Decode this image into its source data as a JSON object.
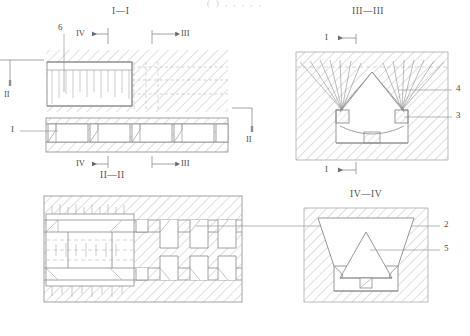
{
  "document": {
    "kind": "patent-figure",
    "cropped_caption_top": "(  )     ,     ,              ,                 ,      ,"
  },
  "views": {
    "section_I": {
      "title": "I—I",
      "callouts": [
        {
          "id": "6",
          "label": "6"
        },
        {
          "id": "1",
          "label": "I"
        }
      ],
      "markers": [
        {
          "label": "IV",
          "direction": "left",
          "position": "top"
        },
        {
          "label": "III",
          "direction": "right",
          "position": "top"
        },
        {
          "label": "II",
          "direction": "down",
          "position": "left"
        },
        {
          "label": "II",
          "direction": "down",
          "position": "right"
        },
        {
          "label": "IV",
          "direction": "left",
          "position": "bottom"
        },
        {
          "label": "III",
          "direction": "right",
          "position": "bottom"
        }
      ]
    },
    "section_II": {
      "title": "II—II",
      "callouts": [
        {
          "id": "2",
          "label": "2"
        }
      ]
    },
    "section_III": {
      "title": "III—III",
      "callouts": [
        {
          "id": "4",
          "label": "4"
        },
        {
          "id": "3",
          "label": "3"
        }
      ],
      "markers": [
        {
          "label": "I",
          "direction": "left",
          "position": "top"
        },
        {
          "label": "I",
          "direction": "left",
          "position": "bottom"
        }
      ]
    },
    "section_IV": {
      "title": "IV—IV",
      "callouts": [
        {
          "id": "5",
          "label": "5"
        }
      ]
    }
  },
  "colors": {
    "stroke": "#8c8c8c",
    "stroke_light": "#b5b5b5",
    "hatch": "#b0b0b0",
    "dash": "#c0c0c0",
    "text": "#4f4f4f",
    "background": "#ffffff"
  }
}
